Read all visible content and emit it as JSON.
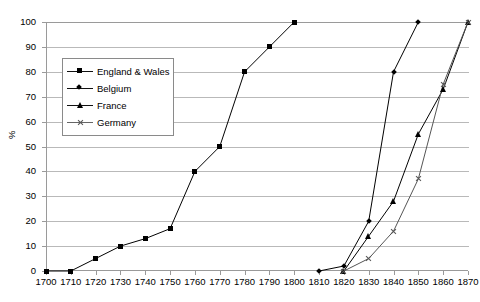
{
  "chart_data": {
    "type": "line",
    "title": "",
    "xlabel": "",
    "ylabel": "%",
    "xlim": [
      1700,
      1870
    ],
    "ylim": [
      0,
      100
    ],
    "xticks": [
      1700,
      1710,
      1720,
      1730,
      1740,
      1750,
      1760,
      1770,
      1780,
      1790,
      1800,
      1810,
      1820,
      1830,
      1840,
      1850,
      1860,
      1870
    ],
    "yticks": [
      0,
      10,
      20,
      30,
      40,
      50,
      60,
      70,
      80,
      90,
      100
    ],
    "grid": true,
    "legend_position": "upper-left-inside",
    "series": [
      {
        "name": "England & Wales",
        "marker": "square",
        "color": "#000000",
        "x": [
          1700,
          1710,
          1720,
          1730,
          1740,
          1750,
          1760,
          1770,
          1780,
          1790,
          1800
        ],
        "values": [
          0,
          0,
          5,
          10,
          13,
          17,
          40,
          50,
          80,
          90,
          100
        ]
      },
      {
        "name": "Belgium",
        "marker": "diamond",
        "color": "#000000",
        "x": [
          1810,
          1820,
          1830,
          1840,
          1850
        ],
        "values": [
          0,
          2,
          20,
          80,
          100
        ]
      },
      {
        "name": "France",
        "marker": "triangle",
        "color": "#000000",
        "x": [
          1820,
          1830,
          1840,
          1850,
          1860,
          1870
        ],
        "values": [
          0,
          14,
          28,
          55,
          73,
          100
        ]
      },
      {
        "name": "Germany",
        "marker": "x",
        "color": "#555555",
        "x": [
          1820,
          1830,
          1840,
          1850,
          1860,
          1870
        ],
        "values": [
          0,
          5,
          16,
          37,
          75,
          100
        ]
      }
    ]
  },
  "axes": {
    "y_title": "%",
    "y_tick_labels": [
      "0",
      "10",
      "20",
      "30",
      "40",
      "50",
      "60",
      "70",
      "80",
      "90",
      "100"
    ],
    "x_tick_labels": [
      "1700",
      "1710",
      "1720",
      "1730",
      "1740",
      "1750",
      "1760",
      "1770",
      "1780",
      "1790",
      "1800",
      "1810",
      "1820",
      "1830",
      "1840",
      "1850",
      "1860",
      "1870"
    ]
  },
  "legend": {
    "items": [
      {
        "label": "England & Wales",
        "marker": "square-marker"
      },
      {
        "label": "Belgium",
        "marker": "diamond-marker"
      },
      {
        "label": "France",
        "marker": "triangle-marker"
      },
      {
        "label": "Germany",
        "marker": "x-marker"
      }
    ]
  },
  "colors": {
    "line": "#000000",
    "germany_line": "#666666",
    "grid": "#b9b9b9",
    "axis": "#9a9a9a"
  }
}
